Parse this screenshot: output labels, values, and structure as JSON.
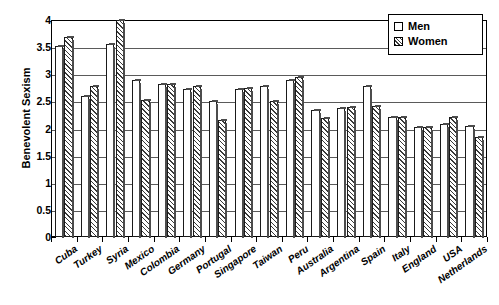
{
  "chart_data": {
    "type": "bar",
    "title": "",
    "xlabel": "",
    "ylabel": "Benevolent Sexism",
    "ylim": [
      0,
      4
    ],
    "ytick_step": 0.5,
    "yticks": [
      "0",
      "0.5",
      "1",
      "1.5",
      "2",
      "2.5",
      "3",
      "3.5",
      "4"
    ],
    "grid": true,
    "grid_axis": "y",
    "legend_position": "top-right",
    "categories": [
      "Cuba",
      "Turkey",
      "Syria",
      "Mexico",
      "Colombia",
      "Germany",
      "Portugal",
      "Singapore",
      "Taiwan",
      "Peru",
      "Australia",
      "Argentina",
      "Spain",
      "Italy",
      "England",
      "USA",
      "Netherlands"
    ],
    "series": [
      {
        "name": "Men",
        "pattern": "open",
        "values": [
          3.52,
          2.6,
          3.55,
          2.9,
          2.82,
          2.72,
          2.5,
          2.72,
          2.78,
          2.9,
          2.35,
          2.38,
          2.78,
          2.22,
          2.02,
          2.08,
          2.05
        ]
      },
      {
        "name": "Women",
        "pattern": "hatched",
        "values": [
          3.68,
          2.78,
          4.0,
          2.53,
          2.82,
          2.78,
          2.15,
          2.75,
          2.5,
          2.95,
          2.2,
          2.4,
          2.42,
          2.22,
          2.02,
          2.22,
          1.85
        ]
      }
    ]
  },
  "legend": {
    "items": [
      {
        "label": "Men",
        "swatch": "open-square-icon"
      },
      {
        "label": "Women",
        "swatch": "hatched-square-icon"
      }
    ]
  },
  "axes": {
    "y_title": "Benevolent Sexism"
  },
  "colors": {
    "axis": "#000000",
    "grid": "#5a5a5a",
    "bar_outline": "#1a1a1a",
    "bar_men_fill": "#ffffff",
    "bar_women_hatch": "#3a3a3a",
    "background": "#ffffff"
  }
}
